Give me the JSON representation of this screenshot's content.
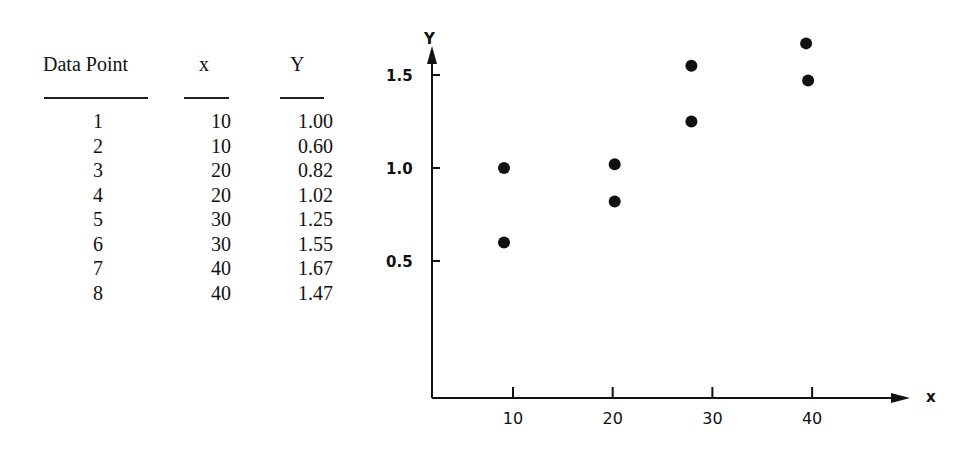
{
  "table": {
    "headers": [
      "Data Point",
      "x",
      "Y"
    ],
    "rows": [
      [
        "1",
        "10",
        "1.00"
      ],
      [
        "2",
        "10",
        "0.60"
      ],
      [
        "3",
        "20",
        "0.82"
      ],
      [
        "4",
        "20",
        "1.02"
      ],
      [
        "5",
        "30",
        "1.25"
      ],
      [
        "6",
        "30",
        "1.55"
      ],
      [
        "7",
        "40",
        "1.67"
      ],
      [
        "8",
        "40",
        "1.47"
      ]
    ]
  },
  "chart_data": {
    "type": "scatter",
    "title": "",
    "xlabel": "x",
    "ylabel": "Y",
    "x_ticks": [
      "10",
      "20",
      "30",
      "40"
    ],
    "y_ticks": [
      "0.5",
      "1.0",
      "1.5"
    ],
    "xlim": [
      2,
      48
    ],
    "ylim": [
      0,
      1.7
    ],
    "grid": false,
    "series": [
      {
        "name": "Data Points",
        "points": [
          {
            "x": 10,
            "y": 1.0
          },
          {
            "x": 10,
            "y": 0.6
          },
          {
            "x": 20,
            "y": 0.82
          },
          {
            "x": 20,
            "y": 1.02
          },
          {
            "x": 30,
            "y": 1.25
          },
          {
            "x": 30,
            "y": 1.55
          },
          {
            "x": 40,
            "y": 1.67
          },
          {
            "x": 40,
            "y": 1.47
          }
        ]
      }
    ]
  }
}
